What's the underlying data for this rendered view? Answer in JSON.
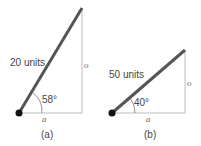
{
  "diagrams": [
    {
      "id": "a",
      "hypotenuse_label": "20 units",
      "angle_label": "58°",
      "opposite_label": "o",
      "adjacent_label": "a",
      "caption": "(a)"
    },
    {
      "id": "b",
      "hypotenuse_label": "50 units",
      "angle_label": "40°",
      "opposite_label": "o",
      "adjacent_label": "a",
      "caption": "(b)"
    }
  ],
  "colors": {
    "hypotenuse": "#555555",
    "legs": "#bbbbbb",
    "text": "#444444"
  }
}
